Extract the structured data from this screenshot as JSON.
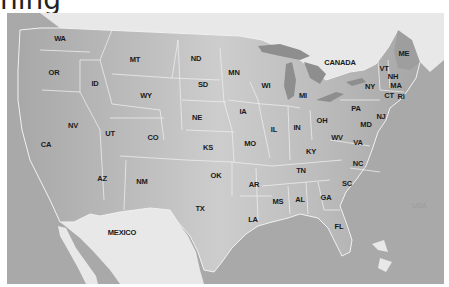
{
  "heading": {
    "text": "ning",
    "right_text": "· · ·"
  },
  "map": {
    "title": "United States map",
    "colors": {
      "ocean": "#a9a9a9",
      "us_land_west": "#b4b4b4",
      "us_land_central": "#c9c9c9",
      "us_land_east": "#b9b9b9",
      "foreign_land": "#e6e6e6",
      "lakes": "#8e8e8e",
      "borders": "#efefef",
      "label": "#1a1a1a"
    },
    "countries": [
      {
        "code": "CANADA",
        "label": "CANADA",
        "x": 340,
        "y": 62
      },
      {
        "code": "MEXICO",
        "label": "MEXICO",
        "x": 122,
        "y": 232
      }
    ],
    "states": [
      {
        "code": "WA",
        "label": "WA",
        "x": 60,
        "y": 38
      },
      {
        "code": "OR",
        "label": "OR",
        "x": 54,
        "y": 72
      },
      {
        "code": "ID",
        "label": "ID",
        "x": 95,
        "y": 83
      },
      {
        "code": "MT",
        "label": "MT",
        "x": 135,
        "y": 59
      },
      {
        "code": "ND",
        "label": "ND",
        "x": 196,
        "y": 58
      },
      {
        "code": "SD",
        "label": "SD",
        "x": 203,
        "y": 84
      },
      {
        "code": "WY",
        "label": "WY",
        "x": 146,
        "y": 95
      },
      {
        "code": "MN",
        "label": "MN",
        "x": 234,
        "y": 72
      },
      {
        "code": "WI",
        "label": "WI",
        "x": 266,
        "y": 85
      },
      {
        "code": "MI",
        "label": "MI",
        "x": 303,
        "y": 95
      },
      {
        "code": "NV",
        "label": "NV",
        "x": 73,
        "y": 125
      },
      {
        "code": "UT",
        "label": "UT",
        "x": 110,
        "y": 133
      },
      {
        "code": "CO",
        "label": "CO",
        "x": 153,
        "y": 137
      },
      {
        "code": "NE",
        "label": "NE",
        "x": 197,
        "y": 117
      },
      {
        "code": "IA",
        "label": "IA",
        "x": 243,
        "y": 111
      },
      {
        "code": "IL",
        "label": "IL",
        "x": 274,
        "y": 129
      },
      {
        "code": "IN",
        "label": "IN",
        "x": 297,
        "y": 127
      },
      {
        "code": "OH",
        "label": "OH",
        "x": 322,
        "y": 120
      },
      {
        "code": "PA",
        "label": "PA",
        "x": 356,
        "y": 108
      },
      {
        "code": "NY",
        "label": "NY",
        "x": 370,
        "y": 86
      },
      {
        "code": "CA",
        "label": "CA",
        "x": 46,
        "y": 144
      },
      {
        "code": "KS",
        "label": "KS",
        "x": 208,
        "y": 147
      },
      {
        "code": "MO",
        "label": "MO",
        "x": 250,
        "y": 143
      },
      {
        "code": "KY",
        "label": "KY",
        "x": 311,
        "y": 151
      },
      {
        "code": "WV",
        "label": "WV",
        "x": 337,
        "y": 137
      },
      {
        "code": "VA",
        "label": "VA",
        "x": 358,
        "y": 142
      },
      {
        "code": "MD",
        "label": "MD",
        "x": 366,
        "y": 124
      },
      {
        "code": "NJ",
        "label": "NJ",
        "x": 381,
        "y": 116
      },
      {
        "code": "AZ",
        "label": "AZ",
        "x": 102,
        "y": 178
      },
      {
        "code": "NM",
        "label": "NM",
        "x": 142,
        "y": 181
      },
      {
        "code": "OK",
        "label": "OK",
        "x": 216,
        "y": 175
      },
      {
        "code": "AR",
        "label": "AR",
        "x": 254,
        "y": 184
      },
      {
        "code": "TN",
        "label": "TN",
        "x": 301,
        "y": 170
      },
      {
        "code": "NC",
        "label": "NC",
        "x": 358,
        "y": 163
      },
      {
        "code": "SC",
        "label": "SC",
        "x": 347,
        "y": 183
      },
      {
        "code": "TX",
        "label": "TX",
        "x": 200,
        "y": 208
      },
      {
        "code": "MS",
        "label": "MS",
        "x": 278,
        "y": 201
      },
      {
        "code": "AL",
        "label": "AL",
        "x": 300,
        "y": 199
      },
      {
        "code": "GA",
        "label": "GA",
        "x": 326,
        "y": 197
      },
      {
        "code": "LA",
        "label": "LA",
        "x": 253,
        "y": 219
      },
      {
        "code": "FL",
        "label": "FL",
        "x": 339,
        "y": 226
      },
      {
        "code": "ME",
        "label": "ME",
        "x": 404,
        "y": 53
      },
      {
        "code": "VT",
        "label": "VT",
        "x": 384,
        "y": 68
      },
      {
        "code": "NH",
        "label": "NH",
        "x": 393,
        "y": 76
      },
      {
        "code": "MA",
        "label": "MA",
        "x": 396,
        "y": 85
      },
      {
        "code": "CT",
        "label": "CT",
        "x": 389,
        "y": 95
      },
      {
        "code": "RI",
        "label": "RI",
        "x": 401,
        "y": 96
      }
    ],
    "watermark": "USA"
  }
}
